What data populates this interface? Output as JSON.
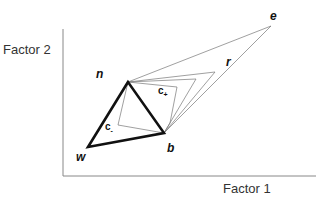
{
  "axes": {
    "x_label": "Factor 1",
    "y_label": "Factor 2"
  },
  "points": {
    "n": {
      "label": "n",
      "x": 128,
      "y": 82
    },
    "w": {
      "label": "w",
      "x": 88,
      "y": 147
    },
    "b": {
      "label": "b",
      "x": 164,
      "y": 133
    },
    "r": {
      "label": "r",
      "x": 215,
      "y": 72
    },
    "e": {
      "label": "e",
      "x": 271,
      "y": 26
    }
  },
  "centroids": {
    "c_minus": {
      "label": "c",
      "sub": "-"
    },
    "c_plus": {
      "label": "c",
      "sub": "+"
    }
  },
  "colors": {
    "thick_line": "#111111",
    "thin_line": "#777777",
    "axis": "#888888"
  }
}
